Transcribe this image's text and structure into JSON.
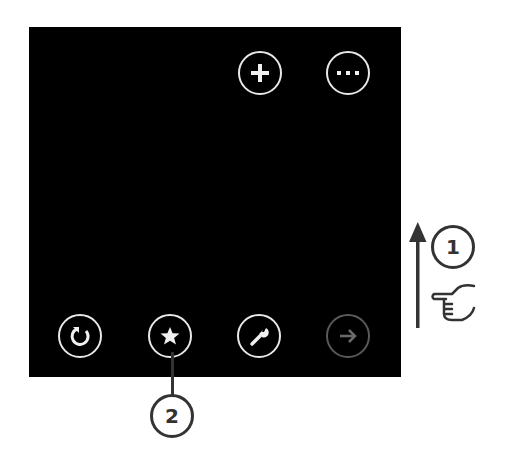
{
  "app_bar": {
    "top_buttons": [
      {
        "name": "add",
        "icon": "plus-icon"
      },
      {
        "name": "more",
        "icon": "more-icon"
      }
    ],
    "bottom_buttons": [
      {
        "name": "refresh",
        "icon": "refresh-icon",
        "enabled": true
      },
      {
        "name": "favorite",
        "icon": "star-icon",
        "enabled": true
      },
      {
        "name": "settings",
        "icon": "wrench-icon",
        "enabled": true
      },
      {
        "name": "forward",
        "icon": "arrow-right-icon",
        "enabled": false
      }
    ]
  },
  "annotations": {
    "callout_1": "1",
    "callout_2": "2",
    "gesture": "swipe-up"
  },
  "colors": {
    "panel": "#000000",
    "icon": "#e8e8e8",
    "disabled_icon": "#5a5a5a",
    "annotation": "#333333"
  }
}
